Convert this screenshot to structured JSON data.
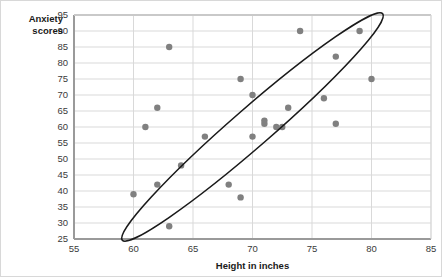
{
  "chart_data": {
    "type": "scatter",
    "title": "",
    "xlabel": "Height in inches",
    "ylabel": "Anxiety scores",
    "xlim": [
      55,
      85
    ],
    "ylim": [
      25,
      95
    ],
    "xticks": [
      55,
      60,
      65,
      70,
      75,
      80,
      85
    ],
    "yticks": [
      25,
      30,
      35,
      40,
      45,
      50,
      55,
      60,
      65,
      70,
      75,
      80,
      85,
      90,
      95
    ],
    "grid": true,
    "legend": false,
    "x": [
      60.0,
      61.0,
      62.0,
      62.0,
      63.0,
      63.0,
      64.0,
      66.0,
      68.0,
      69.0,
      69.0,
      70.0,
      70.0,
      71.0,
      71.0,
      72.0,
      72.5,
      73.0,
      74.0,
      76.0,
      77.0,
      77.0,
      79.0,
      80.0
    ],
    "y": [
      39.0,
      60.0,
      42.0,
      66.0,
      29.0,
      85.0,
      48.0,
      57.0,
      42.0,
      38.0,
      75.0,
      57.0,
      70.0,
      62.0,
      61.0,
      60.0,
      60.0,
      66.0,
      90.0,
      69.0,
      82.0,
      61.0,
      90.0,
      75.0
    ],
    "point_color": "#808080",
    "point_size": 4,
    "annotations": [
      {
        "type": "ellipse",
        "label": "correlation-ellipse",
        "cx": 70.0,
        "cy": 60.0,
        "rx": 14.5,
        "ry": 6.0,
        "rotation_deg": -41,
        "stroke": "#1a1a1a"
      }
    ],
    "axis_color": "#9a9a9a",
    "grid_color": "#d9d9d9",
    "plot_bg": "#ffffff"
  },
  "labels": {
    "y_axis_line1": "Anxiety",
    "y_axis_line2": "scores",
    "x_axis": "Height in inches"
  }
}
